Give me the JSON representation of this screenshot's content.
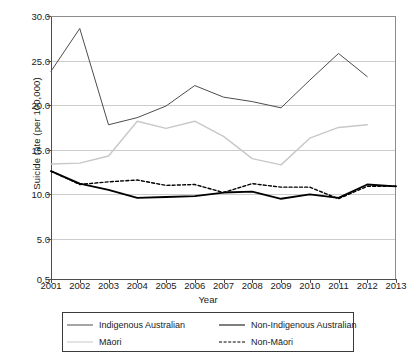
{
  "chart_data": {
    "type": "line",
    "title": "",
    "xlabel": "Year",
    "ylabel": "Suicide rate (per 100,000)",
    "x": [
      2001,
      2002,
      2003,
      2004,
      2005,
      2006,
      2007,
      2008,
      2009,
      2010,
      2011,
      2012,
      2013
    ],
    "categories": [
      "2001",
      "2002",
      "2003",
      "2004",
      "2005",
      "2006",
      "2007",
      "2008",
      "2009",
      "2010",
      "2011",
      "2012",
      "2013"
    ],
    "xlim": [
      2001,
      2013
    ],
    "ylim": [
      0.5,
      30.0
    ],
    "yticks": [
      30.0,
      25.0,
      20.0,
      15.0,
      10.0,
      5.0,
      0.5
    ],
    "ytick_labels": [
      "30.0",
      "25.0",
      "20.0",
      "15.0",
      "10.0",
      "5.0",
      "0.5"
    ],
    "xticks": [
      2001,
      2002,
      2003,
      2004,
      2005,
      2006,
      2007,
      2008,
      2009,
      2010,
      2011,
      2012,
      2013
    ],
    "grid": "horizontal",
    "grid_color": "#cccccc",
    "legend_position": "below-axes",
    "series": [
      {
        "name": "Indigenous Australian",
        "style": "solid-thin",
        "color": "#4d4d4d",
        "width": 1.0,
        "x": [
          2001,
          2002,
          2003,
          2004,
          2005,
          2006,
          2007,
          2008,
          2009,
          2010,
          2011,
          2012
        ],
        "values": [
          23.8,
          28.6,
          17.8,
          18.6,
          19.9,
          22.2,
          20.9,
          20.4,
          19.7,
          22.8,
          25.8,
          23.2
        ]
      },
      {
        "name": "Non-Indigenous Australian",
        "style": "solid-thick",
        "color": "#000000",
        "width": 1.8,
        "x": [
          2001,
          2002,
          2003,
          2004,
          2005,
          2006,
          2007,
          2008,
          2009,
          2010,
          2011,
          2012,
          2013
        ],
        "values": [
          12.6,
          11.2,
          10.5,
          9.6,
          9.7,
          9.8,
          10.2,
          10.3,
          9.5,
          10.0,
          9.6,
          11.1,
          10.9
        ]
      },
      {
        "name": "Māori",
        "style": "solid-light",
        "color": "#c8c8c8",
        "width": 1.4,
        "x": [
          2001,
          2002,
          2003,
          2004,
          2005,
          2006,
          2007,
          2008,
          2009,
          2010,
          2011,
          2012
        ],
        "values": [
          13.4,
          13.5,
          14.3,
          18.2,
          17.4,
          18.2,
          16.5,
          14.0,
          13.3,
          16.3,
          17.5,
          17.8
        ]
      },
      {
        "name": "Non-Māori",
        "style": "dashed",
        "color": "#000000",
        "width": 1.4,
        "x": [
          2001,
          2002,
          2003,
          2004,
          2005,
          2006,
          2007,
          2008,
          2009,
          2010,
          2011,
          2012,
          2013
        ],
        "values": [
          12.6,
          11.1,
          11.4,
          11.6,
          11.0,
          11.1,
          10.2,
          11.2,
          10.8,
          10.8,
          9.5,
          10.9,
          10.9
        ]
      }
    ]
  },
  "legend": {
    "entries": [
      {
        "label": "Indigenous Australian",
        "series": 0
      },
      {
        "label": "Non-Indigenous Australian",
        "series": 1
      },
      {
        "label": "Māori",
        "series": 2
      },
      {
        "label": "Non-Māori",
        "series": 3
      }
    ]
  }
}
